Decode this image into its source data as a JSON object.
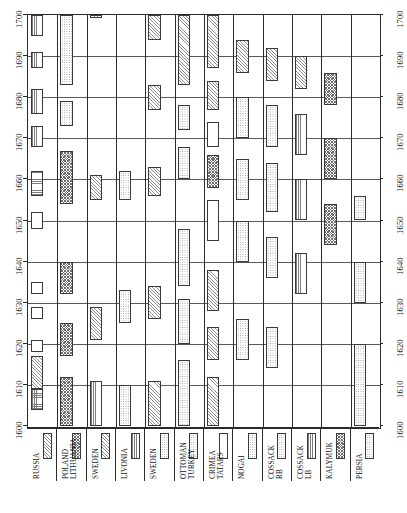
{
  "chart_data": {
    "type": "bar",
    "title": "",
    "subtitle": "",
    "orientation": "rotated-90",
    "xlabel": "",
    "ylabel": "",
    "time_axis": {
      "name": "Year",
      "min": 1600,
      "max": 1700,
      "tick_step": 10,
      "ticks": [
        "1700",
        "1690",
        "1680",
        "1670",
        "1660",
        "1650",
        "1640",
        "1630",
        "1620",
        "1610",
        "1600"
      ],
      "ticks_left": [
        "1700",
        "1690",
        "1680",
        "1670",
        "1660",
        "1650",
        "1640",
        "1630",
        "1620",
        "1610",
        "1600"
      ],
      "ticks_right": [
        "1700",
        "1690",
        "1680",
        "1670",
        "1660",
        "1650",
        "1640",
        "1630",
        "1620",
        "1610",
        "1600"
      ],
      "grid": true,
      "gridlines_at": [
        1600,
        1610,
        1620,
        1630,
        1640,
        1650,
        1660,
        1670,
        1680,
        1690,
        1700
      ]
    },
    "categories": [
      "RUSSIA",
      "POLAND LITHUANIA",
      "SWEDEN",
      "LIVONIA",
      "SWEDEN",
      "OTTOMAN TURKEY",
      "CRIMEA TATARS",
      "NOGAI",
      "COSSACK RB",
      "COSSACK LB",
      "KALYMUK",
      "PERSIA"
    ],
    "legend": {
      "position": "bottom",
      "entries": [
        {
          "label_line1": "RUSSIA",
          "label_line2": "",
          "pattern": "diagonal-hatch"
        },
        {
          "label_line1": "POLAND",
          "label_line2": "LITHUANIA",
          "pattern": "cross-hatch"
        },
        {
          "label_line1": "SWEDEN",
          "label_line2": "",
          "pattern": "diagonal-hatch"
        },
        {
          "label_line1": "LIVONIA",
          "label_line2": "",
          "pattern": "vertical-hatch"
        },
        {
          "label_line1": "SWEDEN",
          "label_line2": "",
          "pattern": "dotted"
        },
        {
          "label_line1": "OTTOMAN",
          "label_line2": "TURKEY",
          "pattern": "dotted"
        },
        {
          "label_line1": "CRIMEA",
          "label_line2": "TATARS",
          "pattern": "blank"
        },
        {
          "label_line1": "NOGAI",
          "label_line2": "",
          "pattern": "dotted"
        },
        {
          "label_line1": "COSSACK",
          "label_line2": "RB",
          "pattern": "dotted"
        },
        {
          "label_line1": "COSSACK",
          "label_line2": "LB",
          "pattern": "vertical-hatch"
        },
        {
          "label_line1": "KALYMUK",
          "label_line2": "",
          "pattern": "cross-hatch"
        },
        {
          "label_line1": "PERSIA",
          "label_line2": "",
          "pattern": "dotted"
        }
      ]
    },
    "columns": [
      {
        "name": "RUSSIA",
        "bars": [
          {
            "start": 1695,
            "end": 1700,
            "pattern": "vertical-hatch",
            "lane": 0,
            "width": 1
          },
          {
            "start": 1687,
            "end": 1691,
            "pattern": "vertical-hatch",
            "lane": 0,
            "width": 1
          },
          {
            "start": 1676,
            "end": 1682,
            "pattern": "vertical-hatch",
            "lane": 0,
            "width": 1
          },
          {
            "start": 1668,
            "end": 1673,
            "pattern": "vertical-hatch",
            "lane": 0,
            "width": 1
          },
          {
            "start": 1656,
            "end": 1662,
            "pattern": "horizontal-hatch",
            "lane": 0,
            "width": 1
          },
          {
            "start": 1648,
            "end": 1652,
            "pattern": "blank",
            "lane": 0,
            "width": 1
          },
          {
            "start": 1632,
            "end": 1635,
            "pattern": "blank",
            "lane": 0,
            "width": 1
          },
          {
            "start": 1626,
            "end": 1629,
            "pattern": "blank",
            "lane": 0,
            "width": 1
          },
          {
            "start": 1618,
            "end": 1621,
            "pattern": "blank",
            "lane": 0,
            "width": 1
          },
          {
            "start": 1609,
            "end": 1617,
            "pattern": "diagonal-hatch",
            "lane": 0,
            "width": 1
          },
          {
            "start": 1604,
            "end": 1609,
            "pattern": "grid",
            "lane": 0,
            "width": 1
          }
        ]
      },
      {
        "name": "POLAND LITHUANIA",
        "bars": [
          {
            "start": 1683,
            "end": 1700,
            "pattern": "dotted",
            "lane": 0,
            "width": 1
          },
          {
            "start": 1673,
            "end": 1679,
            "pattern": "dotted",
            "lane": 0,
            "width": 1
          },
          {
            "start": 1654,
            "end": 1667,
            "pattern": "cross-hatch",
            "lane": 0,
            "width": 1
          },
          {
            "start": 1632,
            "end": 1640,
            "pattern": "cross-hatch",
            "lane": 0,
            "width": 1
          },
          {
            "start": 1617,
            "end": 1625,
            "pattern": "cross-hatch",
            "lane": 0,
            "width": 1
          },
          {
            "start": 1600,
            "end": 1612,
            "pattern": "cross-hatch",
            "lane": 0,
            "width": 1
          }
        ]
      },
      {
        "name": "SWEDEN",
        "bars": [
          {
            "start": 1700,
            "end": 1700,
            "pattern": "diagonal-hatch",
            "lane": 0,
            "width": 1
          },
          {
            "start": 1655,
            "end": 1661,
            "pattern": "diagonal-hatch",
            "lane": 0,
            "width": 1
          },
          {
            "start": 1621,
            "end": 1629,
            "pattern": "diagonal-hatch",
            "lane": 0,
            "width": 1
          },
          {
            "start": 1600,
            "end": 1611,
            "pattern": "vertical-hatch",
            "lane": 0,
            "width": 1
          }
        ]
      },
      {
        "name": "LIVONIA",
        "bars": [
          {
            "start": 1655,
            "end": 1662,
            "pattern": "dotted",
            "lane": 0,
            "width": 1
          },
          {
            "start": 1625,
            "end": 1633,
            "pattern": "dotted",
            "lane": 0,
            "width": 1
          },
          {
            "start": 1600,
            "end": 1610,
            "pattern": "dotted",
            "lane": 0,
            "width": 1
          }
        ]
      },
      {
        "name": "SWEDEN2",
        "bars": [
          {
            "start": 1694,
            "end": 1700,
            "pattern": "diagonal-hatch",
            "lane": 0,
            "width": 1
          },
          {
            "start": 1677,
            "end": 1683,
            "pattern": "diagonal-hatch",
            "lane": 0,
            "width": 1
          },
          {
            "start": 1656,
            "end": 1663,
            "pattern": "diagonal-hatch",
            "lane": 0,
            "width": 1
          },
          {
            "start": 1626,
            "end": 1634,
            "pattern": "diagonal-hatch",
            "lane": 0,
            "width": 1
          },
          {
            "start": 1600,
            "end": 1611,
            "pattern": "diagonal-hatch",
            "lane": 0,
            "width": 1
          }
        ]
      },
      {
        "name": "OTTOMAN TURKEY",
        "bars": [
          {
            "start": 1683,
            "end": 1700,
            "pattern": "diagonal-hatch",
            "lane": 0,
            "width": 1
          },
          {
            "start": 1672,
            "end": 1678,
            "pattern": "dotted",
            "lane": 0,
            "width": 1
          },
          {
            "start": 1660,
            "end": 1668,
            "pattern": "dotted",
            "lane": 0,
            "width": 1
          },
          {
            "start": 1634,
            "end": 1648,
            "pattern": "dotted",
            "lane": 0,
            "width": 1
          },
          {
            "start": 1620,
            "end": 1631,
            "pattern": "dotted",
            "lane": 0,
            "width": 1
          },
          {
            "start": 1600,
            "end": 1616,
            "pattern": "dotted",
            "lane": 0,
            "width": 1
          }
        ]
      },
      {
        "name": "CRIMEA TATARS",
        "bars": [
          {
            "start": 1687,
            "end": 1700,
            "pattern": "diagonal-hatch",
            "lane": 0,
            "width": 1
          },
          {
            "start": 1677,
            "end": 1684,
            "pattern": "diagonal-hatch",
            "lane": 0,
            "width": 1
          },
          {
            "start": 1668,
            "end": 1674,
            "pattern": "blank",
            "lane": 0,
            "width": 1
          },
          {
            "start": 1658,
            "end": 1666,
            "pattern": "cross-hatch",
            "lane": 0,
            "width": 1
          },
          {
            "start": 1645,
            "end": 1655,
            "pattern": "blank",
            "lane": 0,
            "width": 1
          },
          {
            "start": 1628,
            "end": 1638,
            "pattern": "diagonal-hatch",
            "lane": 0,
            "width": 1
          },
          {
            "start": 1616,
            "end": 1624,
            "pattern": "diagonal-hatch",
            "lane": 0,
            "width": 1
          },
          {
            "start": 1600,
            "end": 1612,
            "pattern": "diagonal-hatch",
            "lane": 0,
            "width": 1
          }
        ]
      },
      {
        "name": "NOGAI",
        "bars": [
          {
            "start": 1686,
            "end": 1694,
            "pattern": "diagonal-hatch",
            "lane": 0,
            "width": 1
          },
          {
            "start": 1670,
            "end": 1680,
            "pattern": "dotted",
            "lane": 0,
            "width": 1
          },
          {
            "start": 1655,
            "end": 1665,
            "pattern": "dotted",
            "lane": 0,
            "width": 1
          },
          {
            "start": 1640,
            "end": 1650,
            "pattern": "dotted",
            "lane": 0,
            "width": 1
          },
          {
            "start": 1616,
            "end": 1626,
            "pattern": "dotted",
            "lane": 0,
            "width": 1
          }
        ]
      },
      {
        "name": "COSSACK RB",
        "bars": [
          {
            "start": 1684,
            "end": 1692,
            "pattern": "diagonal-hatch",
            "lane": 0,
            "width": 1
          },
          {
            "start": 1668,
            "end": 1678,
            "pattern": "dotted",
            "lane": 0,
            "width": 1
          },
          {
            "start": 1652,
            "end": 1664,
            "pattern": "dotted",
            "lane": 0,
            "width": 1
          },
          {
            "start": 1636,
            "end": 1646,
            "pattern": "dotted",
            "lane": 0,
            "width": 1
          },
          {
            "start": 1614,
            "end": 1624,
            "pattern": "dotted",
            "lane": 0,
            "width": 1
          }
        ]
      },
      {
        "name": "COSSACK LB",
        "bars": [
          {
            "start": 1682,
            "end": 1690,
            "pattern": "diagonal-hatch",
            "lane": 0,
            "width": 1
          },
          {
            "start": 1666,
            "end": 1676,
            "pattern": "vertical-hatch",
            "lane": 0,
            "width": 1
          },
          {
            "start": 1650,
            "end": 1660,
            "pattern": "vertical-hatch",
            "lane": 0,
            "width": 1
          },
          {
            "start": 1632,
            "end": 1642,
            "pattern": "vertical-hatch",
            "lane": 0,
            "width": 1
          }
        ]
      },
      {
        "name": "KALYMUK",
        "bars": [
          {
            "start": 1678,
            "end": 1686,
            "pattern": "cross-hatch",
            "lane": 0,
            "width": 1
          },
          {
            "start": 1660,
            "end": 1670,
            "pattern": "cross-hatch",
            "lane": 0,
            "width": 1
          },
          {
            "start": 1644,
            "end": 1654,
            "pattern": "cross-hatch",
            "lane": 0,
            "width": 1
          }
        ]
      },
      {
        "name": "PERSIA",
        "bars": [
          {
            "start": 1650,
            "end": 1656,
            "pattern": "dotted",
            "lane": 0,
            "width": 1
          },
          {
            "start": 1630,
            "end": 1640,
            "pattern": "dotted",
            "lane": 0,
            "width": 1
          },
          {
            "start": 1600,
            "end": 1620,
            "pattern": "dotted",
            "lane": 0,
            "width": 1
          }
        ]
      }
    ]
  }
}
